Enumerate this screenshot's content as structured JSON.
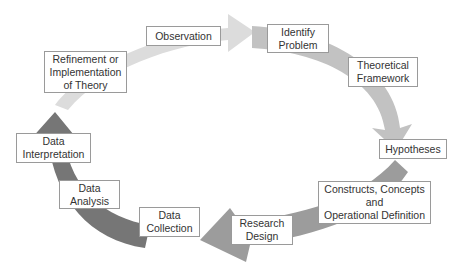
{
  "diagram": {
    "type": "research-process-cycle",
    "direction": "clockwise",
    "steps": [
      {
        "id": "observation",
        "label": "Observation"
      },
      {
        "id": "identify-problem",
        "label": "Identify\nProblem"
      },
      {
        "id": "theoretical-framework",
        "label": "Theoretical\nFramework"
      },
      {
        "id": "hypotheses",
        "label": "Hypotheses"
      },
      {
        "id": "constructs",
        "label": "Constructs, Concepts\nand\nOperational  Definition"
      },
      {
        "id": "research-design",
        "label": "Research\nDesign"
      },
      {
        "id": "data-collection",
        "label": "Data\nCollection"
      },
      {
        "id": "data-analysis",
        "label": "Data\nAnalysis"
      },
      {
        "id": "data-interpretation",
        "label": "Data\nInterpretation"
      },
      {
        "id": "refinement",
        "label": "Refinement or\nImplementation\nof Theory"
      }
    ],
    "arrow_colors": {
      "top_left": "#dcdcdc",
      "top_right": "#c2c2c2",
      "bottom_right": "#9c9c9c",
      "bottom_left": "#767676"
    }
  }
}
